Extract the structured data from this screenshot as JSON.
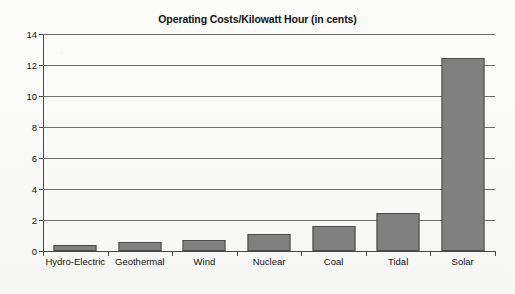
{
  "chart_data": {
    "type": "bar",
    "title": "Operating Costs/Kilowatt Hour (in cents)",
    "xlabel": "",
    "ylabel": "",
    "categories": [
      "Hydro-Electric",
      "Geothermal",
      "Wind",
      "Nuclear",
      "Coal",
      "Tidal",
      "Solar"
    ],
    "values": [
      0.4,
      0.55,
      0.7,
      1.1,
      1.6,
      2.45,
      12.45
    ],
    "ylim": [
      0,
      14
    ],
    "yticks": [
      0,
      2,
      4,
      6,
      8,
      10,
      12,
      14
    ],
    "ytick_labels": [
      "0",
      "2",
      "4",
      "6",
      "8",
      "10",
      "12",
      "14"
    ],
    "grid": true,
    "grid_axis": "y",
    "legend": false,
    "bar_color": "#808080",
    "bar_edge_color": "#4b4b4b",
    "axis_color": "#4a4a4a",
    "background_color": "#fbfbfa",
    "title_color": "#121212"
  }
}
